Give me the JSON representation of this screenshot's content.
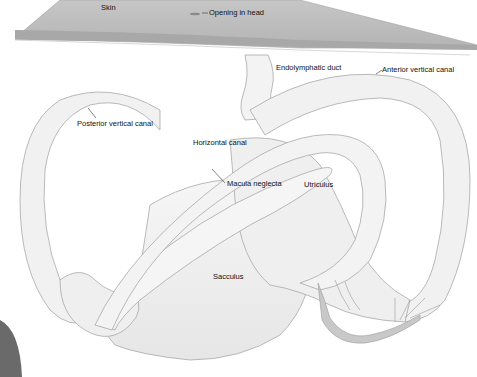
{
  "diagram": {
    "labels": {
      "skin": "Skin",
      "opening": "Opening in head",
      "endolymphatic_duct": "Endolymphatic duct",
      "anterior_vertical_canal": "Anterior vertical canal",
      "posterior_vertical_canal": "Posterior vertical canal",
      "horizontal_canal": "Horizontal canal",
      "macula_neglecta": "Macula neglecta",
      "utriculus": "Utriculus",
      "sacculus": "Sacculus"
    },
    "colors": {
      "background": "#ffffff",
      "skin_top": "#bdbdbd",
      "skin_edge": "#9e9e9e",
      "labyrinth_fill": "#f2f2f2",
      "labyrinth_stroke": "#a8a8a8",
      "label_text": "#111111",
      "nerve": "#9a9a9a"
    }
  }
}
